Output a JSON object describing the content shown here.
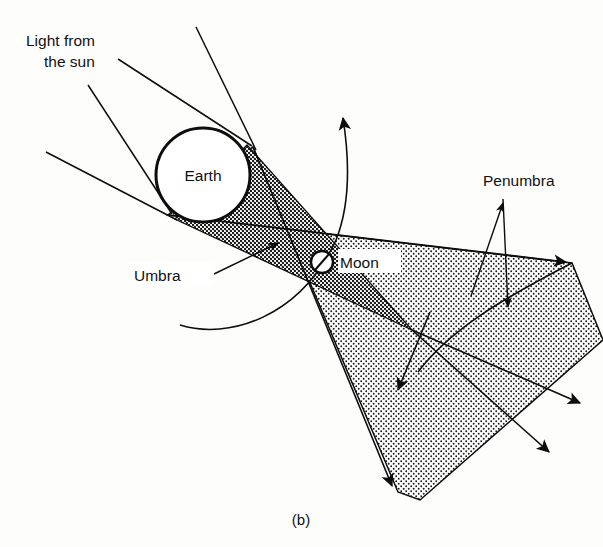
{
  "figure": {
    "caption": "(b)",
    "title_alt": "Lunar eclipse geometry: Earth's umbra and penumbra shadow cones"
  },
  "labels": {
    "light_from_sun_line1": "Light from",
    "light_from_sun_line2": "the sun",
    "earth": "Earth",
    "moon": "Moon",
    "umbra": "Umbra",
    "penumbra": "Penumbra"
  },
  "colors": {
    "ink": "#0d0d0d",
    "background": "#fdfdfc",
    "umbra_fill": "#6f6f6f",
    "penumbra_fill": "#b9b9b9",
    "body_fill": "#ffffff"
  },
  "geometry": {
    "earth": {
      "cx": 203,
      "cy": 175,
      "r": 47
    },
    "moon": {
      "cx": 322,
      "cy": 262,
      "r": 11
    },
    "sun_rays": [
      {
        "x1": 196,
        "y1": 27,
        "x2": 253,
        "y2": 147
      },
      {
        "x1": 118,
        "y1": 59,
        "x2": 250,
        "y2": 144
      },
      {
        "x1": 88,
        "y1": 85,
        "x2": 170,
        "y2": 212
      },
      {
        "x1": 46,
        "y1": 152,
        "x2": 175,
        "y2": 219
      }
    ],
    "penumbra_upper_edge": {
      "x1": 168,
      "y1": 215,
      "x2": 572,
      "y2": 263
    },
    "penumbra_lower_edge": {
      "x1": 253,
      "y1": 147,
      "x2": 398,
      "y2": 492
    },
    "umbra_tip": {
      "x": 412,
      "y": 330
    },
    "orbit_arc_top_arrow": {
      "x": 343,
      "y": 110
    },
    "orbit_arc_bottom_end": {
      "x": 180,
      "y": 325
    },
    "penumbra_leader_apex": {
      "x": 503,
      "y": 199
    },
    "penumbra_leader_arrow_end": {
      "x": 508,
      "y": 313
    }
  }
}
